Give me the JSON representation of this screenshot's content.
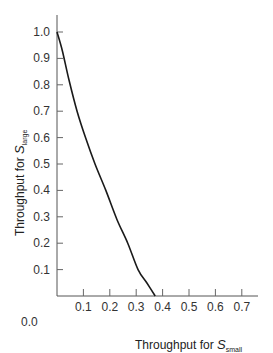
{
  "chart_data": {
    "type": "line",
    "title": "",
    "xlabel": "Throughput for S_small",
    "ylabel": "Throughput for S_large",
    "xlabel_parts": {
      "main": "Throughput for ",
      "var": "S",
      "sub": "small"
    },
    "ylabel_parts": {
      "main": "Throughput for ",
      "var": "S",
      "sub": "large"
    },
    "xlim": [
      0,
      0.75
    ],
    "ylim": [
      0,
      1.05
    ],
    "x_ticks": [
      0.1,
      0.2,
      0.3,
      0.4,
      0.5,
      0.6,
      0.7
    ],
    "x_tick_labels": [
      "0.1",
      "0.2",
      "0.3",
      "0.4",
      "0.5",
      "0.6",
      "0.7"
    ],
    "y_ticks": [
      0.1,
      0.2,
      0.3,
      0.4,
      0.5,
      0.6,
      0.7,
      0.8,
      0.9,
      1.0
    ],
    "y_tick_labels": [
      "0.1",
      "0.2",
      "0.3",
      "0.4",
      "0.5",
      "0.6",
      "0.7",
      "0.8",
      "0.9",
      "1.0"
    ],
    "origin_label": "0.0",
    "grid": false,
    "legend": null,
    "series": [
      {
        "name": "Throughput tradeoff curve",
        "x": [
          0.0,
          0.02,
          0.045,
          0.076,
          0.108,
          0.144,
          0.185,
          0.227,
          0.268,
          0.307,
          0.34,
          0.372
        ],
        "y": [
          1.0,
          0.93,
          0.82,
          0.7,
          0.6,
          0.5,
          0.4,
          0.29,
          0.2,
          0.1,
          0.05,
          0.0
        ]
      }
    ]
  }
}
